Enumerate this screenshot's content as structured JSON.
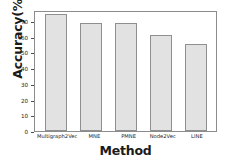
{
  "chart_data": {
    "type": "bar",
    "title": "",
    "xlabel": "Method",
    "ylabel": "Accuracy(%)",
    "categories": [
      "Multigraph2Vec",
      "MNE",
      "PMNE",
      "Node2Vec",
      "LINE"
    ],
    "values": [
      74.5,
      69.0,
      68.5,
      60.8,
      55.5
    ],
    "ylim": [
      0,
      77
    ],
    "yticks": [
      0,
      10,
      20,
      30,
      40,
      50,
      60,
      70
    ],
    "ytick_labels": [
      "0",
      "10",
      "20",
      "30",
      "40",
      "50",
      "60",
      "70"
    ],
    "grid": false,
    "legend": null,
    "bar_fill_color": "#e2e2e2",
    "bar_edge_color": "#8f8f8f",
    "axis_color": "#8c8c8c"
  }
}
